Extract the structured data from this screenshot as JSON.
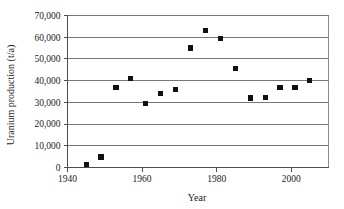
{
  "chart_data": {
    "type": "scatter",
    "title": "",
    "xlabel": "Year",
    "ylabel": "Uranium production (t/a)",
    "xlim": [
      1940,
      2010
    ],
    "ylim": [
      0,
      70000
    ],
    "grid": true,
    "legend": false,
    "xticks": [
      1940,
      1960,
      1980,
      2000
    ],
    "xtick_labels": [
      "1940",
      "1960",
      "1980",
      "2000"
    ],
    "yticks": [
      0,
      10000,
      20000,
      30000,
      40000,
      50000,
      60000,
      70000
    ],
    "ytick_labels": [
      "0",
      "10,000",
      "20,000",
      "30,000",
      "40,000",
      "50,000",
      "60,000",
      "70,000"
    ],
    "marker": "square",
    "marker_color": "#111111",
    "x": [
      1945,
      1949,
      1953,
      1957,
      1961,
      1965,
      1969,
      1973,
      1977,
      1981,
      1985,
      1989,
      1993,
      1997,
      2001,
      2005
    ],
    "y": [
      1200,
      4800,
      36800,
      41000,
      29300,
      33900,
      35900,
      55000,
      63200,
      59400,
      45600,
      32000,
      32100,
      36800,
      36900,
      40200
    ],
    "points": [
      {
        "year": 1945,
        "production": 1200
      },
      {
        "year": 1949,
        "production": 4800
      },
      {
        "year": 1953,
        "production": 36800
      },
      {
        "year": 1957,
        "production": 41000
      },
      {
        "year": 1961,
        "production": 29300
      },
      {
        "year": 1965,
        "production": 33900
      },
      {
        "year": 1969,
        "production": 35900
      },
      {
        "year": 1973,
        "production": 55000
      },
      {
        "year": 1977,
        "production": 63200
      },
      {
        "year": 1981,
        "production": 59400
      },
      {
        "year": 1985,
        "production": 45600
      },
      {
        "year": 1989,
        "production": 32000
      },
      {
        "year": 1993,
        "production": 32100
      },
      {
        "year": 1997,
        "production": 36800
      },
      {
        "year": 2001,
        "production": 36900
      },
      {
        "year": 2005,
        "production": 40200
      }
    ]
  },
  "colors": {
    "background": "#ffffff",
    "marker": "#111111",
    "grid": "#777777",
    "axis": "#4d4d4d",
    "frame": "#8c8c8c",
    "text": "#1a1a1a"
  }
}
